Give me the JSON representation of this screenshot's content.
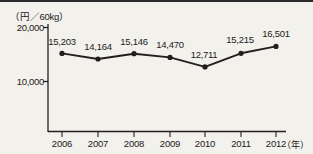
{
  "chart_data": {
    "type": "line",
    "title": "",
    "subtitle": "",
    "xlabel": "（年）",
    "ylabel": "（円／60kg）",
    "categories": [
      "2006",
      "2007",
      "2008",
      "2009",
      "2010",
      "2011",
      "2012"
    ],
    "values": [
      15203,
      14164,
      15146,
      14470,
      12711,
      15215,
      16501
    ],
    "point_labels": [
      "15,203",
      "14,164",
      "15,146",
      "14,470",
      "12,711",
      "15,215",
      "16,501"
    ],
    "yticks": [
      10000,
      20000
    ],
    "ytick_labels": [
      "10,000",
      "20,000"
    ],
    "ylim": [
      0,
      22000
    ],
    "grid": false,
    "legend": null,
    "series": [
      {
        "name": "価格",
        "values": [
          15203,
          14164,
          15146,
          14470,
          12711,
          15215,
          16501
        ]
      }
    ],
    "marker": "filled-circle",
    "line_color": "#231f20",
    "marker_color": "#231f20",
    "background": "#f3f1ec"
  },
  "axes": {
    "y_unit_label": "（円／60kg）",
    "x_unit_label": "（年）"
  }
}
